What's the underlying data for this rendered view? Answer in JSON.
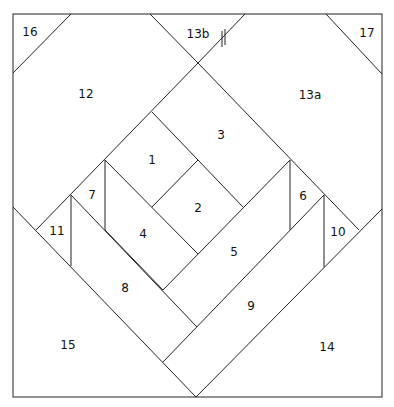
{
  "diagram": {
    "pieces": [
      {
        "id": "1",
        "label": "1",
        "x": 152,
        "y": 160
      },
      {
        "id": "2",
        "label": "2",
        "x": 198,
        "y": 208
      },
      {
        "id": "3",
        "label": "3",
        "x": 221,
        "y": 135
      },
      {
        "id": "4",
        "label": "4",
        "x": 143,
        "y": 234
      },
      {
        "id": "5",
        "label": "5",
        "x": 234,
        "y": 252
      },
      {
        "id": "6",
        "label": "6",
        "x": 303,
        "y": 196
      },
      {
        "id": "7",
        "label": "7",
        "x": 92,
        "y": 195
      },
      {
        "id": "8",
        "label": "8",
        "x": 125,
        "y": 288
      },
      {
        "id": "9",
        "label": "9",
        "x": 251,
        "y": 306
      },
      {
        "id": "10",
        "label": "10",
        "x": 338,
        "y": 232
      },
      {
        "id": "11",
        "label": "11",
        "x": 57,
        "y": 231
      },
      {
        "id": "12",
        "label": "12",
        "x": 86,
        "y": 94
      },
      {
        "id": "13a",
        "label": "13a",
        "x": 310,
        "y": 95
      },
      {
        "id": "13b",
        "label": "13b",
        "x": 198,
        "y": 34
      },
      {
        "id": "14",
        "label": "14",
        "x": 327,
        "y": 347
      },
      {
        "id": "15",
        "label": "15",
        "x": 68,
        "y": 345
      },
      {
        "id": "16",
        "label": "16",
        "x": 30,
        "y": 32
      },
      {
        "id": "17",
        "label": "17",
        "x": 367,
        "y": 33
      }
    ],
    "seam_mark": "double-tick join mark"
  }
}
